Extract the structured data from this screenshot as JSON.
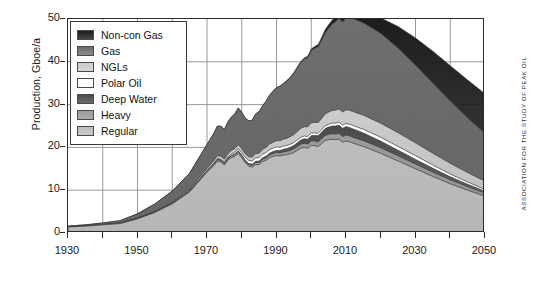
{
  "credit": "Association for the Study of Peak Oil",
  "legend": {
    "position": "top-left",
    "items": [
      {
        "label": "Non-con Gas",
        "color": "#1c1c1c"
      },
      {
        "label": "Gas",
        "color": "#6f6f6f"
      },
      {
        "label": "NGLs",
        "color": "#cccccc"
      },
      {
        "label": "Polar Oil",
        "color": "#ffffff"
      },
      {
        "label": "Deep Water",
        "color": "#4b4b4b"
      },
      {
        "label": "Heavy",
        "color": "#9b9b9b"
      },
      {
        "label": "Regular",
        "color": "#bdbdbd"
      }
    ]
  },
  "chart_data": {
    "type": "area",
    "title": "",
    "subtitle": "",
    "xlabel": "",
    "ylabel": "Production, Gboe/a",
    "xlim": [
      1930,
      2050
    ],
    "ylim": [
      0,
      50
    ],
    "grid": true,
    "stacked": true,
    "xticks": [
      1930,
      1940,
      1950,
      1960,
      1970,
      1980,
      1990,
      2000,
      2010,
      2020,
      2030,
      2040,
      2050
    ],
    "xticklabels": [
      "1930",
      "",
      "1950",
      "",
      "1970",
      "",
      "1990",
      "",
      "2010",
      "",
      "2030",
      "",
      "2050"
    ],
    "yticks": [
      0,
      10,
      20,
      30,
      40,
      50
    ],
    "yticklabels": [
      "0",
      "10",
      "20",
      "30",
      "40",
      "50"
    ],
    "x": [
      1930,
      1935,
      1940,
      1945,
      1950,
      1955,
      1960,
      1965,
      1970,
      1971,
      1972,
      1973,
      1974,
      1975,
      1976,
      1977,
      1978,
      1979,
      1980,
      1981,
      1982,
      1983,
      1984,
      1985,
      1986,
      1987,
      1988,
      1989,
      1990,
      1991,
      1992,
      1993,
      1994,
      1995,
      1996,
      1997,
      1998,
      1999,
      2000,
      2001,
      2002,
      2003,
      2004,
      2005,
      2006,
      2007,
      2008,
      2009,
      2010,
      2011,
      2012,
      2015,
      2020,
      2025,
      2030,
      2035,
      2040,
      2045,
      2050
    ],
    "series": [
      {
        "name": "Regular",
        "color": "#bdbdbd",
        "values": [
          1.4,
          1.6,
          1.9,
          2.2,
          3.3,
          4.8,
          6.8,
          9.6,
          14.2,
          15.0,
          15.8,
          16.8,
          16.6,
          15.9,
          17.0,
          17.6,
          17.9,
          18.6,
          17.6,
          16.4,
          15.6,
          15.4,
          16.0,
          16.0,
          16.7,
          17.0,
          17.6,
          17.9,
          18.1,
          18.0,
          18.2,
          18.3,
          18.5,
          18.8,
          19.3,
          19.8,
          20.0,
          19.8,
          20.5,
          20.4,
          20.2,
          20.9,
          21.6,
          21.8,
          21.9,
          21.8,
          21.9,
          21.2,
          21.5,
          21.3,
          21.0,
          20.2,
          18.6,
          16.8,
          15.0,
          13.2,
          11.5,
          10.0,
          8.6
        ]
      },
      {
        "name": "Heavy",
        "color": "#9b9b9b",
        "values": [
          0.05,
          0.05,
          0.06,
          0.07,
          0.1,
          0.13,
          0.17,
          0.22,
          0.3,
          0.32,
          0.34,
          0.36,
          0.36,
          0.35,
          0.38,
          0.4,
          0.42,
          0.45,
          0.44,
          0.42,
          0.42,
          0.44,
          0.48,
          0.5,
          0.54,
          0.58,
          0.62,
          0.66,
          0.7,
          0.72,
          0.75,
          0.78,
          0.82,
          0.86,
          0.9,
          0.95,
          0.98,
          1.0,
          1.05,
          1.08,
          1.1,
          1.15,
          1.2,
          1.25,
          1.3,
          1.34,
          1.38,
          1.36,
          1.4,
          1.4,
          1.4,
          1.38,
          1.3,
          1.22,
          1.12,
          1.02,
          0.92,
          0.82,
          0.72
        ]
      },
      {
        "name": "Deep Water",
        "color": "#4b4b4b",
        "values": [
          0,
          0,
          0,
          0,
          0,
          0,
          0,
          0,
          0.02,
          0.03,
          0.04,
          0.05,
          0.06,
          0.07,
          0.09,
          0.11,
          0.13,
          0.15,
          0.17,
          0.19,
          0.21,
          0.24,
          0.27,
          0.3,
          0.34,
          0.38,
          0.42,
          0.46,
          0.5,
          0.55,
          0.6,
          0.66,
          0.72,
          0.8,
          0.88,
          0.96,
          1.04,
          1.12,
          1.2,
          1.3,
          1.4,
          1.5,
          1.6,
          1.7,
          1.8,
          1.85,
          1.9,
          1.9,
          1.95,
          1.95,
          1.92,
          1.8,
          1.55,
          1.3,
          1.08,
          0.88,
          0.7,
          0.55,
          0.42
        ]
      },
      {
        "name": "Polar Oil",
        "color": "#ffffff",
        "values": [
          0,
          0,
          0,
          0,
          0,
          0,
          0,
          0,
          0.02,
          0.05,
          0.1,
          0.15,
          0.2,
          0.25,
          0.3,
          0.35,
          0.42,
          0.5,
          0.6,
          0.66,
          0.72,
          0.76,
          0.8,
          0.82,
          0.84,
          0.84,
          0.84,
          0.82,
          0.8,
          0.78,
          0.76,
          0.74,
          0.72,
          0.7,
          0.68,
          0.66,
          0.64,
          0.62,
          0.6,
          0.6,
          0.6,
          0.6,
          0.62,
          0.64,
          0.66,
          0.68,
          0.7,
          0.72,
          0.75,
          0.78,
          0.8,
          0.85,
          0.9,
          0.9,
          0.86,
          0.78,
          0.66,
          0.54,
          0.42
        ]
      },
      {
        "name": "NGLs",
        "color": "#cccccc",
        "values": [
          0.02,
          0.03,
          0.04,
          0.06,
          0.1,
          0.16,
          0.24,
          0.36,
          0.55,
          0.6,
          0.66,
          0.72,
          0.72,
          0.7,
          0.76,
          0.82,
          0.86,
          0.92,
          0.9,
          0.86,
          0.86,
          0.9,
          0.98,
          1.04,
          1.12,
          1.2,
          1.3,
          1.38,
          1.46,
          1.52,
          1.6,
          1.68,
          1.76,
          1.86,
          1.96,
          2.08,
          2.18,
          2.26,
          2.4,
          2.46,
          2.52,
          2.62,
          2.76,
          2.86,
          2.96,
          3.04,
          3.12,
          3.1,
          3.2,
          3.24,
          3.26,
          3.3,
          3.3,
          3.2,
          3.0,
          2.76,
          2.5,
          2.22,
          1.95
        ]
      },
      {
        "name": "Gas",
        "color": "#6f6f6f",
        "values": [
          0.15,
          0.22,
          0.35,
          0.55,
          1.0,
          1.7,
          2.6,
          3.8,
          5.6,
          6.0,
          6.4,
          6.9,
          7.0,
          6.9,
          7.4,
          7.8,
          8.1,
          8.6,
          8.5,
          8.3,
          8.4,
          8.6,
          9.3,
          9.7,
          10.2,
          10.8,
          11.4,
          11.9,
          12.4,
          12.7,
          13.0,
          13.4,
          13.8,
          14.3,
          14.9,
          15.4,
          15.8,
          16.2,
          16.9,
          17.3,
          17.7,
          18.3,
          19.0,
          19.6,
          20.2,
          20.7,
          21.2,
          21.0,
          21.5,
          21.6,
          21.7,
          21.6,
          21.0,
          19.8,
          18.2,
          16.4,
          14.6,
          12.8,
          11.2
        ]
      },
      {
        "name": "Non-con Gas",
        "color": "#1c1c1c",
        "values": [
          0,
          0,
          0,
          0,
          0,
          0,
          0,
          0,
          0,
          0,
          0,
          0,
          0,
          0,
          0,
          0,
          0,
          0,
          0,
          0,
          0,
          0,
          0,
          0,
          0,
          0,
          0,
          0,
          0.02,
          0.03,
          0.05,
          0.07,
          0.1,
          0.13,
          0.17,
          0.21,
          0.25,
          0.3,
          0.36,
          0.42,
          0.5,
          0.58,
          0.68,
          0.78,
          0.9,
          1.0,
          1.1,
          1.2,
          1.35,
          1.5,
          1.7,
          2.3,
          3.6,
          5.0,
          6.3,
          7.4,
          8.2,
          8.8,
          9.2
        ]
      }
    ]
  }
}
